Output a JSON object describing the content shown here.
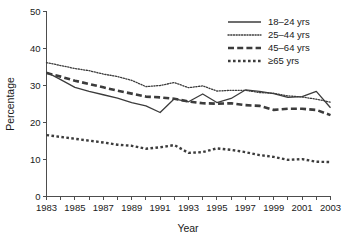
{
  "chart_data": {
    "type": "line",
    "title": "",
    "xlabel": "Year",
    "ylabel": "Percentage",
    "xlim": [
      1983,
      2003
    ],
    "ylim": [
      0,
      50
    ],
    "ytick_values": [
      0,
      10,
      20,
      30,
      40,
      50
    ],
    "ytick_labels": [
      "0",
      "10",
      "20",
      "30",
      "40",
      "50"
    ],
    "xtick_values": [
      1983,
      1984,
      1985,
      1986,
      1987,
      1988,
      1989,
      1990,
      1991,
      1992,
      1993,
      1994,
      1995,
      1996,
      1997,
      1998,
      1999,
      2000,
      2001,
      2002,
      2003
    ],
    "xtick_labels": [
      "1983",
      "",
      "1985",
      "",
      "1987",
      "",
      "1989",
      "",
      "1991",
      "",
      "1993",
      "",
      "1995",
      "",
      "1997",
      "",
      "1999",
      "",
      "2001",
      "",
      "2003"
    ],
    "grid": false,
    "legend_position": "upper right",
    "x": [
      1983,
      1984,
      1985,
      1986,
      1987,
      1988,
      1989,
      1990,
      1991,
      1992,
      1993,
      1994,
      1995,
      1996,
      1997,
      1998,
      1999,
      2000,
      2001,
      2002,
      2003
    ],
    "series": [
      {
        "name": "18–24 yrs",
        "style": "solid",
        "values": [
          33.6,
          31.6,
          29.5,
          28.4,
          27.5,
          26.6,
          25.4,
          24.5,
          22.7,
          26.4,
          25.6,
          27.7,
          25.4,
          26.5,
          28.8,
          28.4,
          27.8,
          26.8,
          27.0,
          28.4,
          24.0
        ]
      },
      {
        "name": "25–44 yrs",
        "style": "fine-dotted",
        "values": [
          36.2,
          35.4,
          34.6,
          34.0,
          33.1,
          32.4,
          31.4,
          29.7,
          30.0,
          30.8,
          29.4,
          29.9,
          28.5,
          28.7,
          28.7,
          28.1,
          27.9,
          27.2,
          26.9,
          26.3,
          25.5
        ]
      },
      {
        "name": "45–64 yrs",
        "style": "thick-dashed",
        "values": [
          33.4,
          32.4,
          31.3,
          30.4,
          29.5,
          28.6,
          27.8,
          27.0,
          26.8,
          26.4,
          25.7,
          25.2,
          25.1,
          25.2,
          24.7,
          24.5,
          23.4,
          23.7,
          23.7,
          23.4,
          22.0
        ]
      },
      {
        "name": "≥65 yrs",
        "style": "thick-dotted",
        "values": [
          16.6,
          16.1,
          15.6,
          15.1,
          14.6,
          14.0,
          13.7,
          12.9,
          13.3,
          13.9,
          11.8,
          12.0,
          13.0,
          12.6,
          12.0,
          11.2,
          10.7,
          9.9,
          10.1,
          9.4,
          9.3
        ]
      }
    ]
  }
}
